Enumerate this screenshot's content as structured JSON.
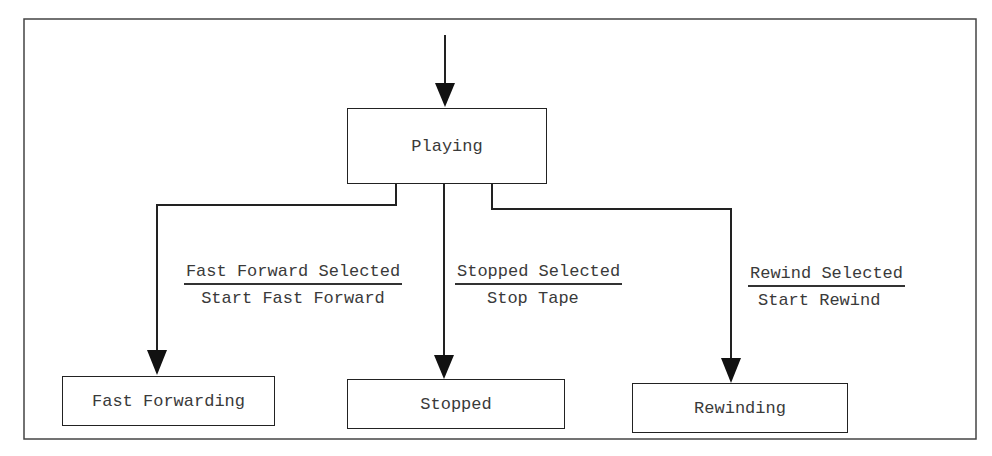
{
  "diagram": {
    "type": "state-transition",
    "states": [
      {
        "id": "playing",
        "label": "Playing",
        "initial": true
      },
      {
        "id": "fast_forwarding",
        "label": "Fast Forwarding"
      },
      {
        "id": "stopped",
        "label": "Stopped"
      },
      {
        "id": "rewinding",
        "label": "Rewinding"
      }
    ],
    "transitions": [
      {
        "from": "playing",
        "to": "fast_forwarding",
        "event": "Fast Forward Selected",
        "action": "Start Fast Forward"
      },
      {
        "from": "playing",
        "to": "stopped",
        "event": "Stopped Selected",
        "action": "Stop Tape"
      },
      {
        "from": "playing",
        "to": "rewinding",
        "event": "Rewind Selected",
        "action": "Start Rewind"
      }
    ]
  },
  "colors": {
    "line": "#222222",
    "text": "#3a3a3a",
    "background": "#ffffff"
  }
}
